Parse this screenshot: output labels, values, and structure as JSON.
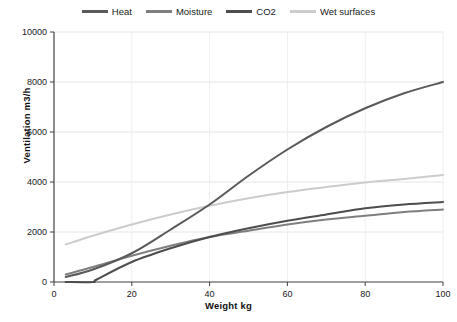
{
  "chart_data": {
    "type": "line",
    "title": "",
    "xlabel": "Weight kg",
    "ylabel": "Ventilation m3/h",
    "xlim": [
      0,
      100
    ],
    "ylim": [
      0,
      10000
    ],
    "xticks": [
      0,
      20,
      40,
      60,
      80,
      100
    ],
    "yticks": [
      0,
      2000,
      4000,
      6000,
      8000,
      10000
    ],
    "grid": "horizontal-major-light",
    "legend_position": "top-center",
    "series": [
      {
        "name": "Heat",
        "color": "#595959",
        "x": [
          3,
          10,
          20,
          30,
          40,
          50,
          60,
          70,
          80,
          90,
          100
        ],
        "values": [
          200,
          500,
          1150,
          2100,
          3100,
          4250,
          5300,
          6200,
          6950,
          7550,
          8000
        ]
      },
      {
        "name": "Moisture",
        "color": "#7f7f7f",
        "x": [
          3,
          10,
          20,
          30,
          40,
          50,
          60,
          70,
          80,
          90,
          100
        ],
        "values": [
          300,
          600,
          1050,
          1450,
          1800,
          2050,
          2300,
          2500,
          2650,
          2800,
          2900
        ]
      },
      {
        "name": "CO2",
        "color": "#4d4d4d",
        "x": [
          3,
          10,
          11,
          20,
          30,
          40,
          50,
          60,
          70,
          80,
          90,
          100
        ],
        "values": [
          0,
          0,
          100,
          800,
          1350,
          1800,
          2150,
          2450,
          2700,
          2950,
          3100,
          3200
        ]
      },
      {
        "name": "Wet surfaces",
        "color": "#cccccc",
        "x": [
          3,
          10,
          20,
          30,
          40,
          50,
          60,
          70,
          80,
          90,
          100
        ],
        "values": [
          1500,
          1850,
          2300,
          2700,
          3050,
          3350,
          3600,
          3800,
          3980,
          4120,
          4280
        ]
      }
    ]
  },
  "legend": {
    "items": [
      {
        "label": "Heat",
        "color": "#595959"
      },
      {
        "label": "Moisture",
        "color": "#7f7f7f"
      },
      {
        "label": "CO2",
        "color": "#4d4d4d"
      },
      {
        "label": "Wet surfaces",
        "color": "#cccccc"
      }
    ]
  },
  "axes": {
    "y_title": "Ventilation m3/h",
    "x_title": "Weight kg",
    "y_tick_labels": [
      "10000",
      "8000",
      "6000",
      "4000",
      "2000",
      "0"
    ],
    "x_tick_labels": [
      "0",
      "20",
      "40",
      "60",
      "80",
      "100"
    ]
  }
}
